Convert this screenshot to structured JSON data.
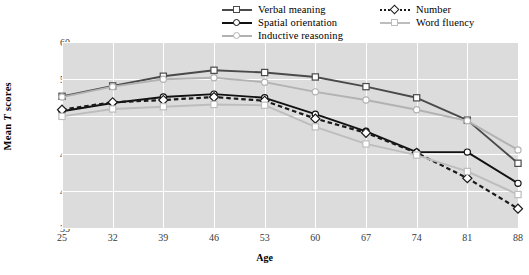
{
  "chart_data": {
    "type": "line",
    "title": "",
    "xlabel": "Age",
    "ylabel": "Mean T scores",
    "categories": [
      25,
      32,
      39,
      46,
      53,
      60,
      67,
      74,
      81,
      88
    ],
    "x": [
      25,
      32,
      39,
      46,
      53,
      60,
      67,
      74,
      81,
      88
    ],
    "xlim": [
      25,
      88
    ],
    "ylim": [
      35,
      60
    ],
    "yticks": [
      35,
      40,
      45,
      50,
      55,
      60
    ],
    "xticks": [
      25,
      32,
      39,
      46,
      53,
      60,
      67,
      74,
      81,
      88
    ],
    "grid": true,
    "legend_position": "top-center",
    "series": [
      {
        "name": "Verbal meaning",
        "color": "#4a4a4a",
        "marker": "square",
        "dash": false,
        "values": [
          52.7,
          54.1,
          55.4,
          56.2,
          55.9,
          55.3,
          54.0,
          52.5,
          49.5,
          43.7
        ]
      },
      {
        "name": "Spatial orientation",
        "color": "#111111",
        "marker": "circle",
        "dash": false,
        "values": [
          50.7,
          51.8,
          52.6,
          53.0,
          52.5,
          50.3,
          48.0,
          45.2,
          45.2,
          41.0
        ]
      },
      {
        "name": "Inductive reasoning",
        "color": "#b2b2b2",
        "marker": "circle",
        "dash": false,
        "values": [
          52.6,
          54.0,
          55.0,
          55.2,
          54.6,
          53.3,
          52.2,
          50.9,
          49.4,
          45.5
        ]
      },
      {
        "name": "Number",
        "color": "#1a1a1a",
        "marker": "diamond",
        "dash": true,
        "values": [
          50.9,
          51.9,
          52.2,
          52.6,
          52.1,
          49.7,
          47.8,
          45.1,
          41.7,
          37.6
        ]
      },
      {
        "name": "Word fluency",
        "color": "#bdbdbd",
        "marker": "square",
        "dash": false,
        "values": [
          50.0,
          51.0,
          51.3,
          51.6,
          51.5,
          48.6,
          46.3,
          44.8,
          42.6,
          39.5
        ]
      }
    ]
  },
  "axes": {
    "y_title_pre": "Mean ",
    "y_title_italic": "T",
    "y_title_post": " scores",
    "x_title": "Age"
  },
  "legend": {
    "items": [
      {
        "label": "Verbal meaning",
        "marker": "square",
        "dash": false,
        "col": 0,
        "row": 0
      },
      {
        "label": "Spatial orientation",
        "marker": "circle",
        "dash": false,
        "col": 0,
        "row": 1
      },
      {
        "label": "Inductive reasoning",
        "marker": "circle",
        "dash": false,
        "col": 0,
        "row": 2
      },
      {
        "label": "Number",
        "marker": "diamond",
        "dash": true,
        "col": 1,
        "row": 0
      },
      {
        "label": "Word fluency",
        "marker": "square",
        "dash": false,
        "col": 1,
        "row": 1
      }
    ]
  },
  "colors": {
    "plot_background": "#dcdcdc",
    "gridline": "#ffffff",
    "marker_fill": "#ffffff",
    "text": "#000000",
    "tick_text": "#3a3a3a"
  }
}
